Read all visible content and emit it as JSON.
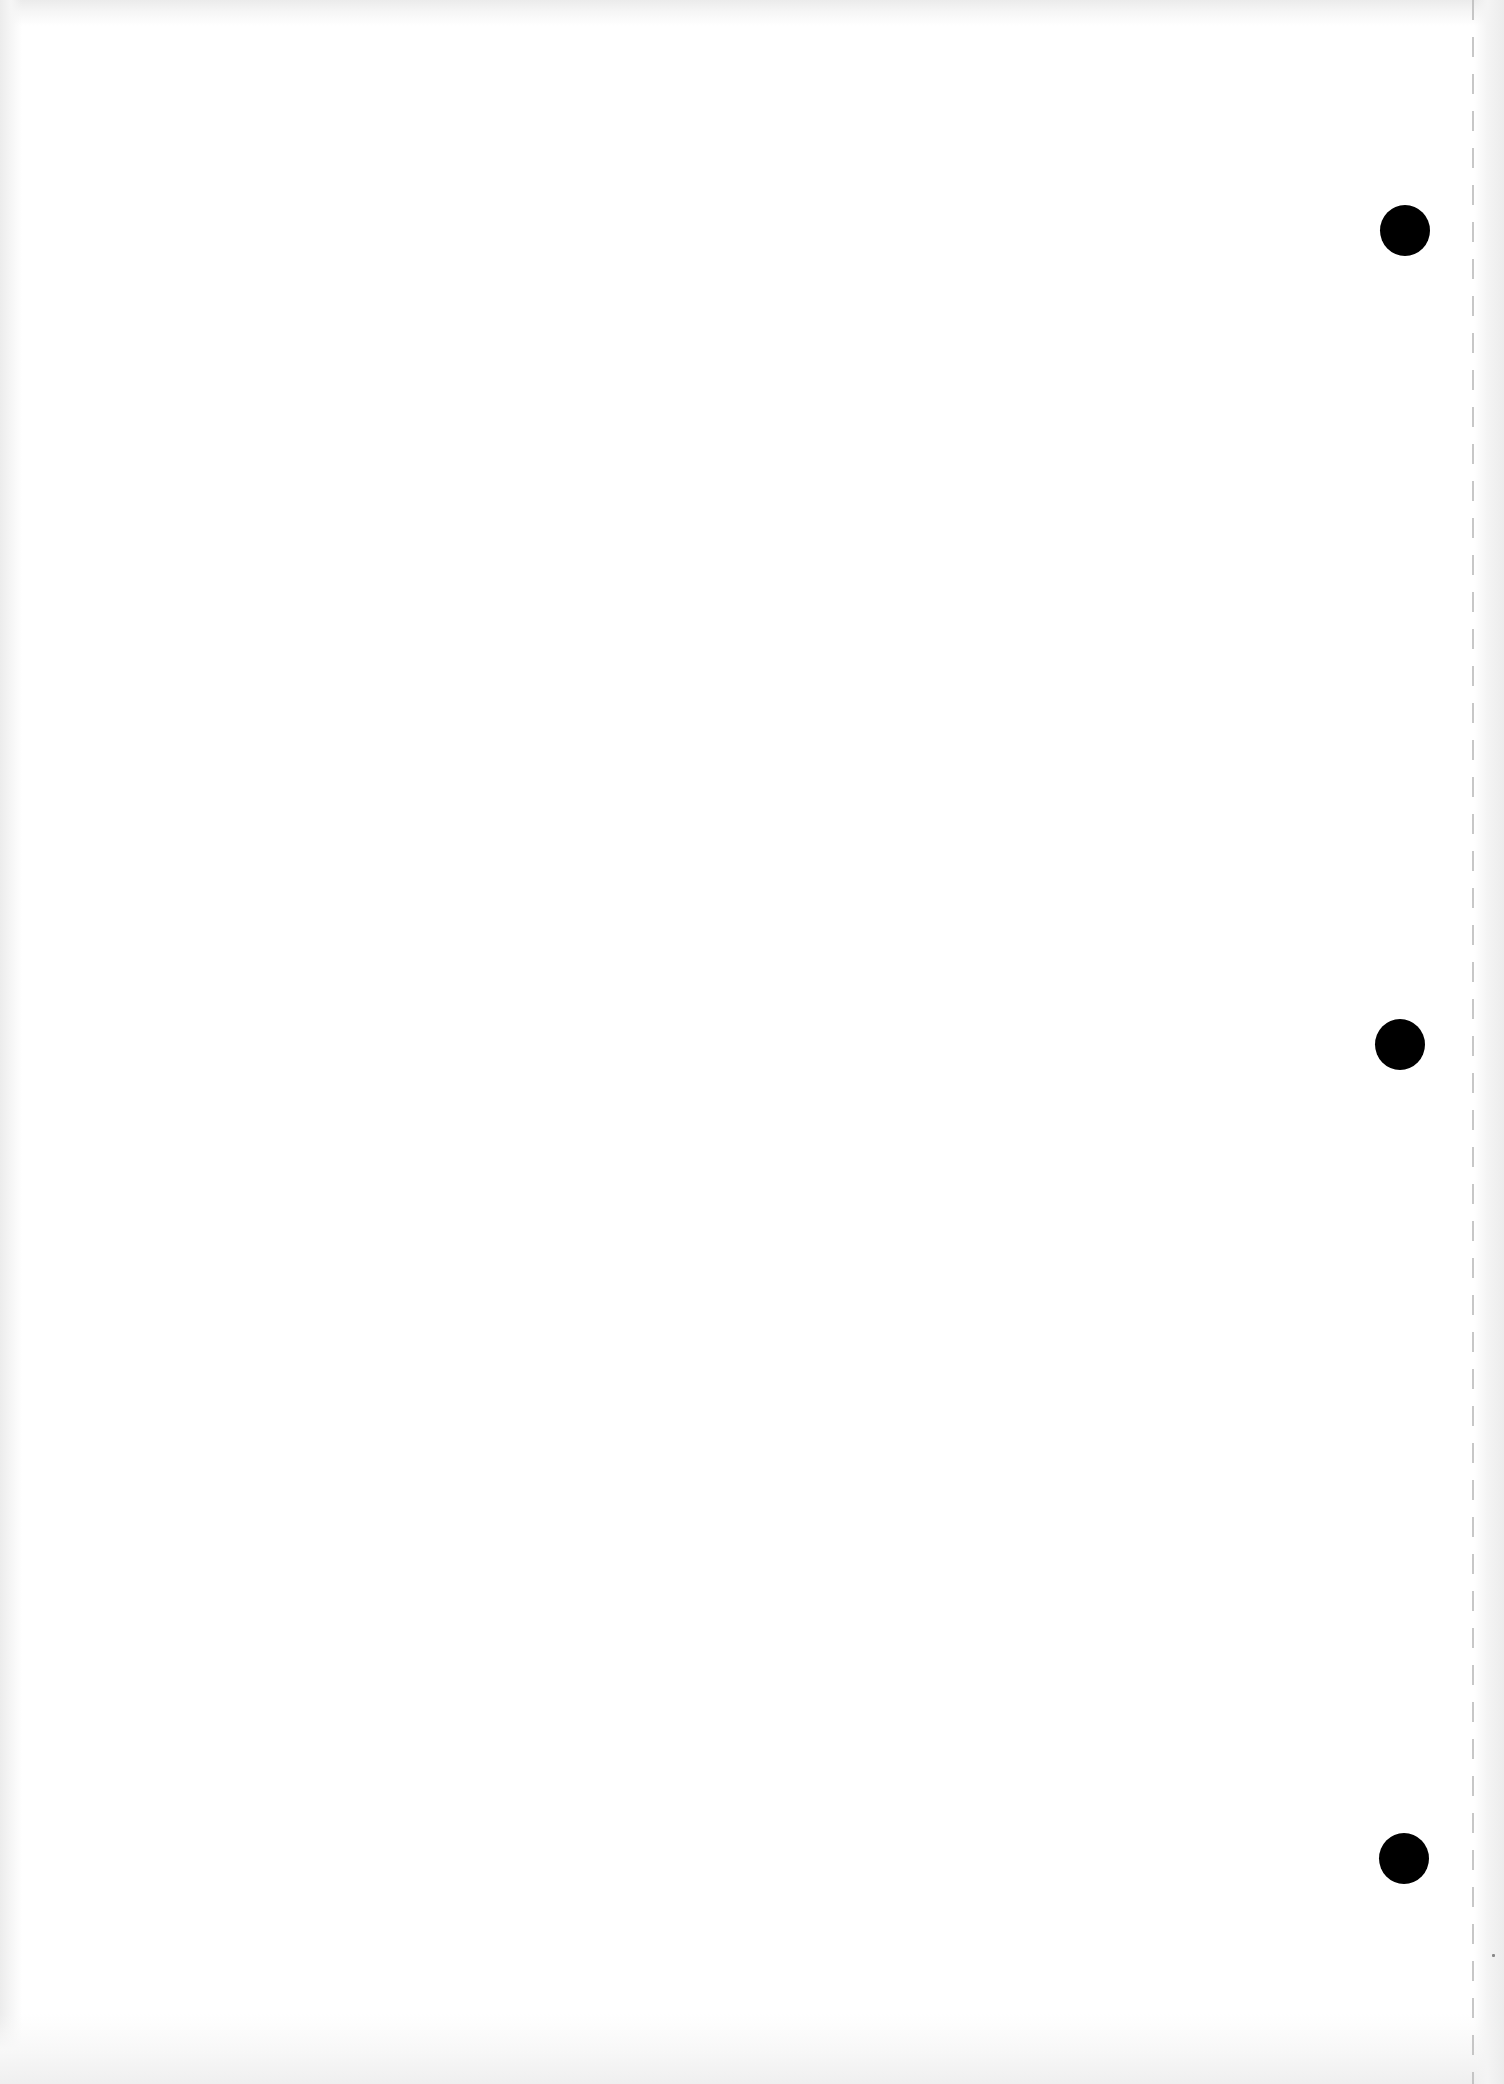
{
  "document": {
    "type": "blank scanned sheet",
    "background_color": "#ffffff",
    "text_content": ""
  },
  "binder_holes": [
    {
      "name": "top",
      "center_x": 1405,
      "center_y": 230,
      "diameter": 50,
      "color": "#000000"
    },
    {
      "name": "middle",
      "center_x": 1400,
      "center_y": 1044,
      "diameter": 50,
      "color": "#000000"
    },
    {
      "name": "bottom",
      "center_x": 1404,
      "center_y": 1858,
      "diameter": 50,
      "color": "#000000"
    }
  ],
  "perforation_line": {
    "x": 1473,
    "style": "dashed",
    "color": "#bdbdbd"
  }
}
